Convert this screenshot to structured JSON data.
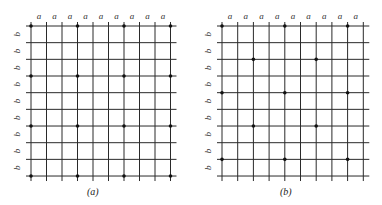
{
  "figure": {
    "panels": [
      {
        "id": "a",
        "caption": "(a)",
        "origin_x": 31,
        "spacing_x": 15.5,
        "columns": 10,
        "col_label": "a",
        "row_label": "b",
        "dots": [
          [
            0,
            0
          ],
          [
            0,
            3
          ],
          [
            0,
            6
          ],
          [
            0,
            9
          ],
          [
            3,
            0
          ],
          [
            3,
            3
          ],
          [
            3,
            6
          ],
          [
            3,
            9
          ],
          [
            6,
            0
          ],
          [
            6,
            3
          ],
          [
            6,
            6
          ],
          [
            6,
            9
          ],
          [
            9,
            0
          ],
          [
            9,
            3
          ],
          [
            9,
            6
          ],
          [
            9,
            9
          ]
        ]
      },
      {
        "id": "b",
        "caption": "(b)",
        "origin_x": 222,
        "spacing_x": 15.7,
        "columns": 10,
        "col_label": "a",
        "row_label": "b",
        "dots": [
          [
            0,
            0
          ],
          [
            0,
            4
          ],
          [
            0,
            8
          ],
          [
            2,
            2
          ],
          [
            2,
            6
          ],
          [
            4,
            0
          ],
          [
            4,
            4
          ],
          [
            4,
            8
          ],
          [
            6,
            2
          ],
          [
            6,
            6
          ],
          [
            8,
            0
          ],
          [
            8,
            4
          ],
          [
            8,
            8
          ]
        ]
      }
    ],
    "grid": {
      "rows": 10,
      "origin_y": 26,
      "spacing_y": 16.67,
      "line_color": "#2a2a2a",
      "dot_color": "#111111"
    }
  }
}
